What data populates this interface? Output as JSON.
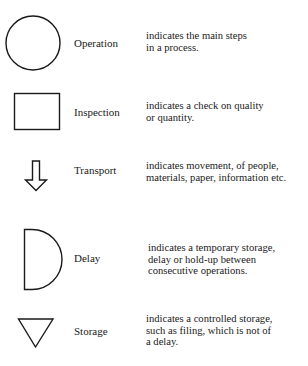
{
  "legend": {
    "items": [
      {
        "symbol": "circle",
        "label": "Operation",
        "description_lines": [
          "indicates the main steps",
          "in a process."
        ]
      },
      {
        "symbol": "rectangle",
        "label": "Inspection",
        "description_lines": [
          "indicates  a check on quality",
          "or quantity."
        ]
      },
      {
        "symbol": "down-arrow",
        "label": "Transport",
        "description_lines": [
          "indicates movement, of people,",
          "materials, paper, information etc."
        ]
      },
      {
        "symbol": "d-shape",
        "label": "Delay",
        "description_lines": [
          "indicates a temporary storage,",
          "delay or hold-up between",
          "consecutive operations."
        ]
      },
      {
        "symbol": "inverted-triangle",
        "label": "Storage",
        "description_lines": [
          "indicates a controlled storage,",
          "such as filing, which is not of",
          "a delay."
        ]
      }
    ]
  },
  "colors": {
    "stroke": "#1a1a1a",
    "background": "#ffffff"
  }
}
